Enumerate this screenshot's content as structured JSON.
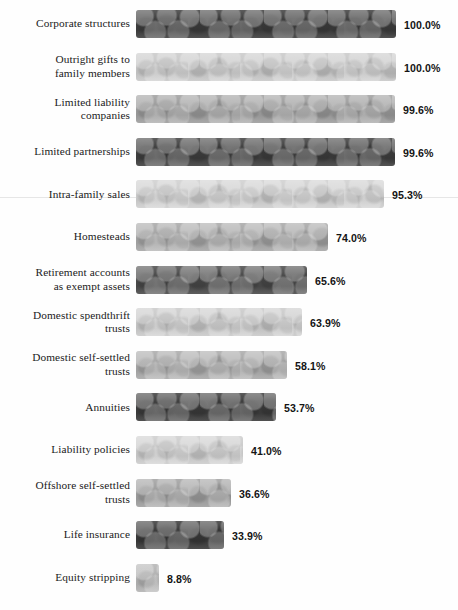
{
  "chart_data": {
    "type": "bar",
    "orientation": "horizontal",
    "title": "",
    "subtitle": "",
    "xlabel": "",
    "ylabel": "",
    "xlim": [
      0,
      100
    ],
    "grid": false,
    "legend": null,
    "value_suffix": "%",
    "categories": [
      "Corporate structures",
      "Outright gifts to\nfamily members",
      "Limited liability\ncompanies",
      "Limited partnerships",
      "Intra-family sales",
      "Homesteads",
      "Retirement accounts\nas exempt assets",
      "Domestic spendthrift\ntrusts",
      "Domestic self-settled\ntrusts",
      "Annuities",
      "Liability policies",
      "Offshore self-settled\ntrusts",
      "Life insurance",
      "Equity stripping"
    ],
    "values": [
      100.0,
      100.0,
      99.6,
      99.6,
      95.3,
      74.0,
      65.6,
      63.9,
      58.1,
      53.7,
      41.0,
      36.6,
      33.9,
      8.8
    ],
    "value_labels": [
      "100.0%",
      "100.0%",
      "99.6%",
      "99.6%",
      "95.3%",
      "74.0%",
      "65.6%",
      "63.9%",
      "58.1%",
      "53.7%",
      "41.0%",
      "36.6%",
      "33.9%",
      "8.8%"
    ],
    "bar_colors": [
      "#3d3d3d",
      "#c9c9c9",
      "#9e9e9e",
      "#3f3f3f",
      "#cfcfcf",
      "#a7a7a7",
      "#4a4a4a",
      "#cacaca",
      "#a9a9a9",
      "#3c3c3c",
      "#cdcdcd",
      "#a0a0a0",
      "#393939",
      "#b4b4b4"
    ]
  },
  "colors": {
    "background": "#fefefe",
    "label_text": "#1b1b1b",
    "value_text": "#141414",
    "scan_line": "#e2e2e2"
  }
}
